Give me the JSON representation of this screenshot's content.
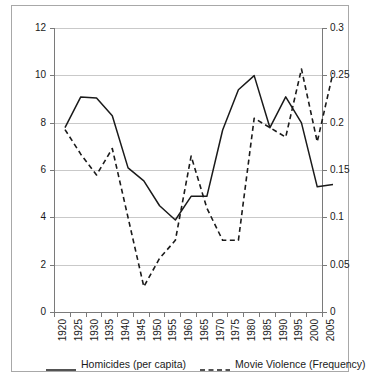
{
  "chart_data": {
    "type": "line",
    "title": "",
    "xlabel": "",
    "ylabel": "",
    "grid": true,
    "legend_position": "bottom",
    "x": [
      1920,
      1925,
      1930,
      1935,
      1940,
      1945,
      1950,
      1955,
      1960,
      1965,
      1970,
      1975,
      1980,
      1985,
      1990,
      1995,
      2000,
      2005
    ],
    "categories": [
      "1920",
      "1925",
      "1930",
      "1935",
      "1940",
      "1945",
      "1950",
      "1955",
      "1960",
      "1965",
      "1970",
      "1975",
      "1980",
      "1985",
      "1990",
      "1995",
      "2000",
      "2005"
    ],
    "axes": {
      "left": {
        "label": "",
        "ylim": [
          0,
          12
        ],
        "ticks": [
          "0",
          "2",
          "4",
          "6",
          "8",
          "10",
          "12"
        ],
        "tick_values": [
          0,
          2,
          4,
          6,
          8,
          10,
          12
        ]
      },
      "right": {
        "label": "",
        "ylim": [
          0,
          0.3
        ],
        "ticks": [
          "0",
          "0.05",
          "0.1",
          "0.15",
          "0.2",
          "0.25",
          "0.3"
        ],
        "tick_values": [
          0,
          0.05,
          0.1,
          0.15,
          0.2,
          0.25,
          0.3
        ]
      }
    },
    "series": [
      {
        "name": "Homicides (per capita)",
        "axis": "left",
        "style": "solid",
        "color": "#1a1a1a",
        "values": [
          8.0,
          9.3,
          9.25,
          8.5,
          6.3,
          5.75,
          4.7,
          4.1,
          5.1,
          5.1,
          7.9,
          9.6,
          10.2,
          8.0,
          9.3,
          8.2,
          5.5,
          5.6
        ]
      },
      {
        "name": "Movie Violence (Frequency)",
        "axis": "right",
        "style": "dashed",
        "color": "#1a1a1a",
        "values": [
          0.198,
          0.172,
          0.15,
          0.178,
          0.105,
          0.032,
          0.062,
          0.081,
          0.17,
          0.115,
          0.081,
          0.081,
          0.21,
          0.2,
          0.19,
          0.262,
          0.185,
          0.258
        ]
      }
    ]
  },
  "legend": {
    "entries": [
      {
        "label": "Homicides (per capita)",
        "style": "solid"
      },
      {
        "label": "Movie Violence (Frequency)",
        "style": "dashed"
      }
    ]
  }
}
